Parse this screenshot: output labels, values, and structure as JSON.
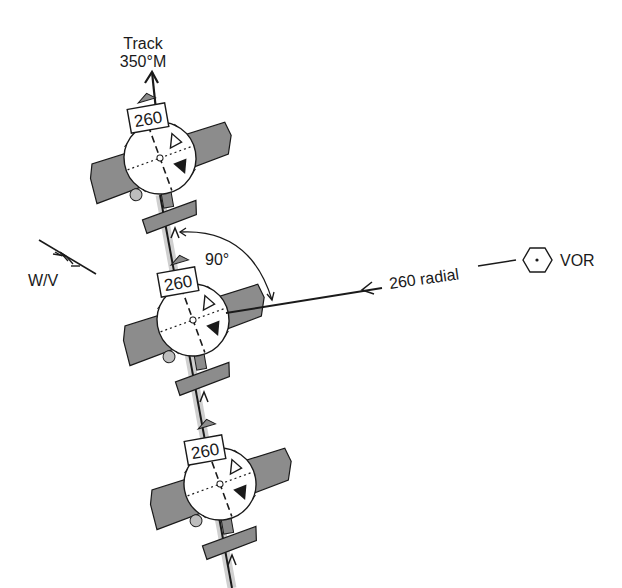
{
  "diagram": {
    "track_label_line1": "Track",
    "track_label_line2": "350°M",
    "wind_label": "W/V",
    "angle_label": "90°",
    "radial_label": "260 radial",
    "station_label": "VOR",
    "aircraft": [
      {
        "heading_box": "260"
      },
      {
        "heading_box": "260"
      },
      {
        "heading_box": "260"
      }
    ],
    "colors": {
      "line": "#1a1a1a",
      "wing_fill": "#8c8c8c",
      "track_shade": "#cfcfcf",
      "background": "#ffffff"
    }
  }
}
